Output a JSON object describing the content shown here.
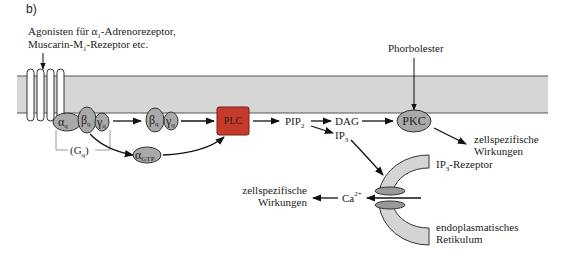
{
  "panel_label": "b)",
  "agonist_label": {
    "line1_pre": "Agonisten für ",
    "line1_greek": "α",
    "line1_sub": "1",
    "line1_post": "-Adrenorezeptor,",
    "line2_pre": "Muscarin-M",
    "line2_sub": "1",
    "line2_post": "-Rezeptor etc."
  },
  "phorbol_label": "Phorbolester",
  "gprotein": {
    "alpha": {
      "symbol": "α",
      "sub": "q"
    },
    "beta": {
      "symbol": "β",
      "sub": "q"
    },
    "gamma": {
      "symbol": "γ",
      "sub": "q"
    },
    "complex_label_pre": "(G",
    "complex_label_sub": "q",
    "complex_label_post": ")"
  },
  "beta_gamma": {
    "beta": {
      "symbol": "β",
      "sub": "q"
    },
    "gamma": {
      "symbol": "γ",
      "sub": "q"
    }
  },
  "alpha_gtp": {
    "symbol": "α",
    "sub": "GTP"
  },
  "plc_label": "PLC",
  "pip2": {
    "main": "PIP",
    "sub": "2"
  },
  "dag_label": "DAG",
  "ip3": {
    "main": "IP",
    "sub": "3"
  },
  "pkc_label": "PKC",
  "pkc_effects": {
    "line1": "zellspezifische",
    "line2": "Wirkungen"
  },
  "ip3_receptor": {
    "main": "IP",
    "sub": "3",
    "post": "-Rezeptor"
  },
  "er_label": {
    "line1": "endoplasmatisches",
    "line2": "Retikulum"
  },
  "calcium": {
    "main": "Ca",
    "sup": "2+"
  },
  "ca_effects": {
    "line1": "zellspezifische",
    "line2": "Wirkungen"
  },
  "colors": {
    "membrane_fill": "#d6d6d6",
    "membrane_line": "#555555",
    "protein_fill": "#a9a9a9",
    "protein_stroke": "#333333",
    "plc_fill": "#c63a2b",
    "plc_stroke": "#7a1d14",
    "er_fill": "#d4d4d4",
    "arrow": "#111111"
  }
}
